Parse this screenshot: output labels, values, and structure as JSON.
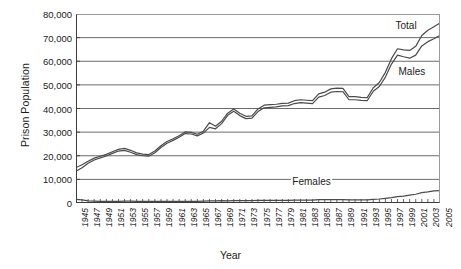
{
  "chart_data": {
    "type": "line",
    "title": "",
    "xlabel": "Year",
    "ylabel": "Prison Population",
    "xlim": [
      1945,
      2005
    ],
    "ylim": [
      0,
      80000
    ],
    "grid": true,
    "legend_position": "inline-annotations",
    "y_ticks": [
      0,
      10000,
      20000,
      30000,
      40000,
      50000,
      60000,
      70000,
      80000
    ],
    "y_tick_labels": [
      "0",
      "10,000",
      "20,000",
      "30,000",
      "40,000",
      "50,000",
      "60,000",
      "70,000",
      "80,000"
    ],
    "x_ticks": [
      1945,
      1946,
      1947,
      1948,
      1949,
      1950,
      1951,
      1952,
      1953,
      1954,
      1955,
      1956,
      1957,
      1958,
      1959,
      1960,
      1961,
      1962,
      1963,
      1964,
      1965,
      1966,
      1967,
      1968,
      1969,
      1970,
      1971,
      1972,
      1973,
      1974,
      1975,
      1976,
      1977,
      1978,
      1979,
      1980,
      1981,
      1982,
      1983,
      1984,
      1985,
      1986,
      1987,
      1988,
      1989,
      1990,
      1991,
      1992,
      1993,
      1994,
      1995,
      1996,
      1997,
      1998,
      1999,
      2000,
      2001,
      2002,
      2003,
      2004,
      2005
    ],
    "x_tick_labels": [
      "1945",
      "1947",
      "1949",
      "1951",
      "1953",
      "1955",
      "1957",
      "1959",
      "1961",
      "1963",
      "1965",
      "1967",
      "1969",
      "1971",
      "1973",
      "1975",
      "1977",
      "1979",
      "1981",
      "1983",
      "1985",
      "1987",
      "1989",
      "1991",
      "1993",
      "1995",
      "1997",
      "1999",
      "2001",
      "2003",
      "2005"
    ],
    "x": [
      1945,
      1946,
      1947,
      1948,
      1949,
      1950,
      1951,
      1952,
      1953,
      1954,
      1955,
      1956,
      1957,
      1958,
      1959,
      1960,
      1961,
      1962,
      1963,
      1964,
      1965,
      1966,
      1967,
      1968,
      1969,
      1970,
      1971,
      1972,
      1973,
      1974,
      1975,
      1976,
      1977,
      1978,
      1979,
      1980,
      1981,
      1982,
      1983,
      1984,
      1985,
      1986,
      1987,
      1988,
      1989,
      1990,
      1991,
      1992,
      1993,
      1994,
      1995,
      1996,
      1997,
      1998,
      1999,
      2000,
      2001,
      2002,
      2003,
      2004,
      2005
    ],
    "series": [
      {
        "name": "Total",
        "color": "#4a4a4a",
        "values": [
          15000,
          16200,
          17700,
          19000,
          19800,
          20600,
          21700,
          22700,
          23100,
          22300,
          21200,
          20700,
          20500,
          22000,
          24200,
          26000,
          27200,
          28500,
          30100,
          29900,
          29100,
          30400,
          34000,
          32500,
          34600,
          38000,
          39800,
          38000,
          36700,
          36900,
          39800,
          41400,
          41600,
          41800,
          42200,
          42300,
          43300,
          43700,
          43500,
          43300,
          46200,
          46900,
          48300,
          48600,
          48500,
          45000,
          45000,
          44700,
          44600,
          48800,
          51000,
          55300,
          61100,
          65300,
          64800,
          64600,
          66300,
          70900,
          73100,
          74600,
          76200
        ]
      },
      {
        "name": "Males",
        "color": "#4a4a4a",
        "values": [
          13500,
          14900,
          16800,
          18200,
          19100,
          19900,
          21000,
          22000,
          22300,
          21500,
          20500,
          20000,
          19800,
          21300,
          23500,
          25300,
          26500,
          27800,
          29400,
          29200,
          28400,
          29600,
          32000,
          31400,
          33600,
          37100,
          38800,
          37000,
          35700,
          35900,
          38700,
          40300,
          40500,
          40700,
          41100,
          41200,
          42100,
          42500,
          42300,
          42100,
          44800,
          45500,
          46900,
          47200,
          47100,
          43700,
          43700,
          43400,
          43300,
          47300,
          49300,
          53300,
          58800,
          62600,
          61900,
          61300,
          62600,
          66500,
          68300,
          69500,
          71000
        ]
      },
      {
        "name": "Females",
        "color": "#4a4a4a",
        "values": [
          1500,
          1300,
          900,
          800,
          700,
          700,
          700,
          700,
          800,
          800,
          700,
          700,
          700,
          700,
          700,
          700,
          700,
          700,
          700,
          700,
          700,
          800,
          900,
          900,
          1000,
          900,
          1000,
          1000,
          1000,
          1000,
          1100,
          1100,
          1100,
          1100,
          1100,
          1100,
          1200,
          1200,
          1200,
          1200,
          1400,
          1400,
          1400,
          1400,
          1400,
          1300,
          1300,
          1300,
          1300,
          1500,
          1700,
          2000,
          2300,
          2700,
          2900,
          3300,
          3700,
          4400,
          4700,
          5100,
          5200
        ]
      }
    ],
    "annotations": [
      {
        "text": "Total",
        "x": 1997.5,
        "y": 75000
      },
      {
        "text": "Males",
        "x": 1998.0,
        "y": 55500
      },
      {
        "text": "Females",
        "x": 1980.5,
        "y": 8800
      }
    ]
  }
}
